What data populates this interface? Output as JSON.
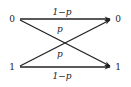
{
  "diagram": {
    "type": "binary-symmetric-channel",
    "inputs": [
      {
        "id": "in0",
        "label": "0"
      },
      {
        "id": "in1",
        "label": "1"
      }
    ],
    "outputs": [
      {
        "id": "out0",
        "label": "0"
      },
      {
        "id": "out1",
        "label": "1"
      }
    ],
    "edges": [
      {
        "from": "in0",
        "to": "out0",
        "label": "1−p"
      },
      {
        "from": "in0",
        "to": "out1",
        "label": "p"
      },
      {
        "from": "in1",
        "to": "out0",
        "label": "p"
      },
      {
        "from": "in1",
        "to": "out1",
        "label": "1−p"
      }
    ]
  }
}
